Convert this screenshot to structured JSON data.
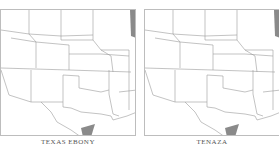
{
  "panels": [
    {
      "label": "TEXAS EBONY",
      "shade_color": "#8a8a8a",
      "range": "south Texas tip"
    },
    {
      "label": "TENAZA",
      "shade_color": "#8a8a8a",
      "range": "south Texas tip"
    }
  ],
  "colors": {
    "border": "#bdbdbd",
    "state_lines": "#9a9a9a",
    "shade": "#8a8a8a"
  }
}
